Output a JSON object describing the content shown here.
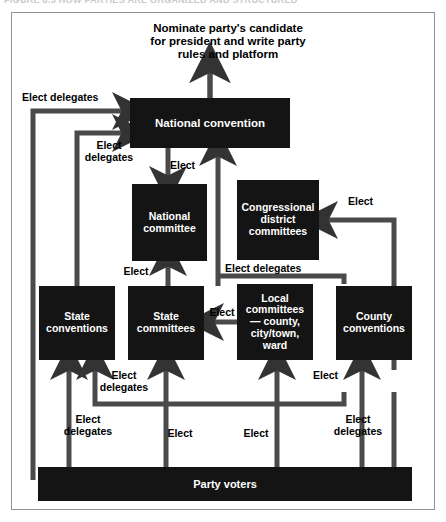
{
  "caption": {
    "text": "FIGURE 8.3  HOW PARTIES ARE ORGANIZED AND STRUCTURED"
  },
  "diagram": {
    "outcome_text": "Nominate party's candidate\nfor president and write party\nrules and platform",
    "colors": {
      "node_fill": "#141414",
      "node_text": "#ffffff",
      "connector": "#4a4a4a",
      "frame": "#8f9296",
      "background": "#ffffff",
      "label_text": "#000000"
    },
    "nodes": [
      {
        "id": "national-convention",
        "label": "National\nconvention"
      },
      {
        "id": "national-committee",
        "label": "National\ncommittee"
      },
      {
        "id": "congressional-district-committees",
        "label": "Congressional\ndistrict\ncommittees"
      },
      {
        "id": "state-conventions",
        "label": "State\nconventions"
      },
      {
        "id": "state-committees",
        "label": "State\ncommittees"
      },
      {
        "id": "local-committees",
        "label": "Local\ncommittees—\ncounty,\ncity/town,\nward"
      },
      {
        "id": "county-conventions",
        "label": "County\nconventions"
      },
      {
        "id": "party-voters",
        "label": "Party voters"
      }
    ],
    "edge_labels": {
      "elect_delegates_top_left": "Elect delegates",
      "elect_delegates_left2": "Elect\ndelegates",
      "elect_to_national_committee": "Elect",
      "elect_to_congressional": "Elect",
      "elect_delegates_mid": "Elect delegates",
      "elect_state_committees_to_convention": "Elect",
      "elect_local_to_state_committees": "Elect",
      "elect_delegates_bottom1": "Elect\ndelegates",
      "elect_bottom2": "Elect",
      "elect_delegates_bottom3": "Elect\ndelegates",
      "elect_bottom4": "Elect",
      "elect_bottom5": "Elect",
      "elect_delegates_bottom6": "Elect\ndelegates"
    },
    "edges": [
      {
        "from": "national-convention",
        "to": "outcome",
        "label": ""
      },
      {
        "from": "state-conventions",
        "to": "national-convention",
        "label": "Elect delegates"
      },
      {
        "from": "state-committees",
        "to": "national-convention",
        "label": "Elect delegates"
      },
      {
        "from": "national-convention",
        "to": "national-committee",
        "label": "Elect"
      },
      {
        "from": "state-committees",
        "to": "national-convention",
        "label": "Elect"
      },
      {
        "from": "county-conventions",
        "to": "congressional-district-committees",
        "label": "Elect"
      },
      {
        "from": "county-conventions",
        "to": "national-convention",
        "label": "Elect delegates"
      },
      {
        "from": "state-committees",
        "to": "national-committee",
        "label": "Elect"
      },
      {
        "from": "local-committees",
        "to": "state-committees",
        "label": "Elect"
      },
      {
        "from": "party-voters",
        "to": "state-conventions",
        "label": "Elect delegates"
      },
      {
        "from": "party-voters",
        "to": "state-committees",
        "label": "Elect"
      },
      {
        "from": "party-voters",
        "to": "local-committees",
        "label": "Elect"
      },
      {
        "from": "party-voters",
        "to": "county-conventions",
        "label": "Elect delegates"
      }
    ]
  }
}
